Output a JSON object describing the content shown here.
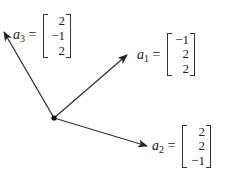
{
  "diagram": {
    "type": "vector-diagram",
    "origin": {
      "x": 54,
      "y": 118
    },
    "vectors": [
      {
        "id": "a1",
        "symbol": "a",
        "subscript": "1",
        "equals": "=",
        "components": [
          "−1",
          "2",
          "2"
        ],
        "tip": {
          "x": 127,
          "y": 55
        }
      },
      {
        "id": "a2",
        "symbol": "a",
        "subscript": "2",
        "equals": "=",
        "components": [
          "2",
          "2",
          "−1"
        ],
        "tip": {
          "x": 147,
          "y": 146
        }
      },
      {
        "id": "a3",
        "symbol": "a",
        "subscript": "3",
        "equals": "=",
        "components": [
          "2",
          "−1",
          "2"
        ],
        "tip": {
          "x": 4,
          "y": 32
        }
      }
    ]
  }
}
